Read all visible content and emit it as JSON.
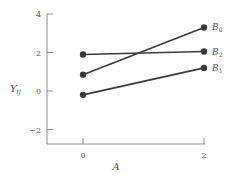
{
  "chart_data": {
    "type": "line",
    "title": "",
    "xlabel": "A",
    "ylabel": "Y_ij",
    "x": [
      0,
      2
    ],
    "xticks": [
      0,
      2
    ],
    "yticks": [
      -2,
      0,
      2,
      4
    ],
    "xlim": [
      -0.6,
      2.0
    ],
    "ylim": [
      -2.8,
      4
    ],
    "grid": false,
    "legend_position": "inline-right",
    "series": [
      {
        "name": "B0",
        "label_main": "B",
        "label_sub": "0",
        "values": [
          0.85,
          3.3
        ]
      },
      {
        "name": "B2",
        "label_main": "B",
        "label_sub": "2",
        "values": [
          1.9,
          2.05
        ]
      },
      {
        "name": "B1",
        "label_main": "B",
        "label_sub": "1",
        "values": [
          -0.2,
          1.2
        ]
      }
    ]
  },
  "labels": {
    "xlabel": "A",
    "ylabel_main": "Y",
    "ylabel_sub": "ij"
  },
  "colors": {
    "line": "#3a3a3a",
    "axis": "#8a8a8a",
    "text": "#555555"
  }
}
